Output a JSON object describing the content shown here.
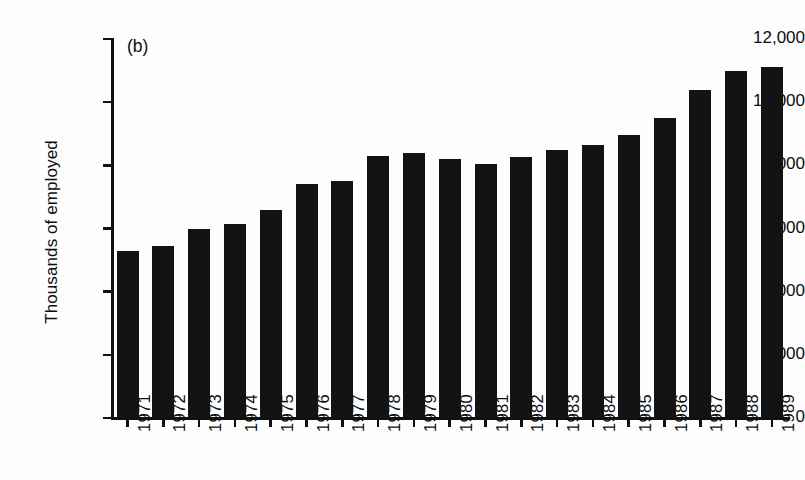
{
  "panel_label": "(b)",
  "chart_data": {
    "type": "bar",
    "title": "",
    "subtitle": "",
    "panel": "(b)",
    "xlabel": "",
    "ylabel": "Thousands of employed",
    "categories": [
      "1971",
      "1972",
      "1973",
      "1974",
      "1975",
      "1976",
      "1977",
      "1978",
      "1979",
      "1980",
      "1981",
      "1982",
      "1983",
      "1984",
      "1985",
      "1986",
      "1987",
      "1988",
      "1989"
    ],
    "values": [
      5300,
      5450,
      6000,
      6150,
      6600,
      7400,
      7500,
      8300,
      8400,
      8200,
      8050,
      8250,
      8500,
      8650,
      8950,
      9500,
      10400,
      11000,
      11100
    ],
    "ylim": [
      0,
      12000
    ],
    "ytick_values": [
      0,
      2000,
      4000,
      6000,
      8000,
      10000,
      12000
    ],
    "ytick_labels": [
      "0",
      "2,000",
      "4,000",
      "6,000",
      "8,000",
      "10,000",
      "12,000"
    ],
    "grid": false,
    "legend": null,
    "bar_color": "#131313",
    "axis_color": "#111111",
    "background_color": "#fdfdfd",
    "xtick_label_rotation": 90
  }
}
